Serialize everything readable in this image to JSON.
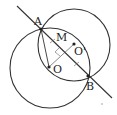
{
  "diagram": {
    "type": "geometry",
    "labels": {
      "A": "A",
      "B": "B",
      "M": "M",
      "O": "O",
      "O_prime": "O'"
    },
    "colors": {
      "stroke": "#333333",
      "background": "#ffffff"
    },
    "points": {
      "A": [
        41,
        29
      ],
      "B": [
        88,
        76
      ],
      "M": [
        64,
        52
      ],
      "O": [
        49,
        67
      ],
      "O_prime": [
        74,
        44
      ]
    },
    "circles": [
      {
        "name": "circle-O",
        "center": [
          50,
          68
        ],
        "r": 40
      },
      {
        "name": "circle-O-prime",
        "center": [
          74,
          45
        ],
        "r": 36
      }
    ]
  }
}
